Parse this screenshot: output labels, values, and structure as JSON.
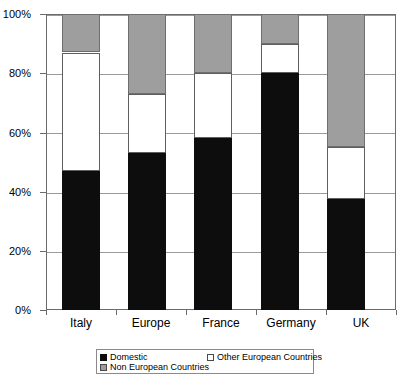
{
  "chart_data": {
    "type": "bar",
    "subtype": "stacked-100-percent",
    "title": "",
    "xlabel": "",
    "ylabel": "",
    "ylim": [
      0,
      100
    ],
    "yticks": [
      "0%",
      "20%",
      "40%",
      "60%",
      "80%",
      "100%"
    ],
    "ytick_values": [
      0,
      20,
      40,
      60,
      80,
      100
    ],
    "grid": true,
    "legend_position": "bottom",
    "categories": [
      "Italy",
      "Europe",
      "France",
      "Germany",
      "UK"
    ],
    "series": [
      {
        "name": "Domestic",
        "color": "#0d0d0d",
        "values": [
          47,
          53,
          58,
          80,
          37.5
        ]
      },
      {
        "name": "Other European Countries",
        "color": "#ffffff",
        "values": [
          40,
          20,
          22,
          10,
          17.5
        ]
      },
      {
        "name": "Non European Countries",
        "color": "#9e9e9e",
        "values": [
          13,
          27,
          20,
          10,
          45
        ]
      }
    ],
    "cumulative_tops": [
      {
        "category": "Italy",
        "domestic": 47,
        "through_other": 87,
        "through_non": 100
      },
      {
        "category": "Europe",
        "domestic": 53,
        "through_other": 73,
        "through_non": 100
      },
      {
        "category": "France",
        "domestic": 58,
        "through_other": 80,
        "through_non": 100
      },
      {
        "category": "Germany",
        "domestic": 80,
        "through_other": 90,
        "through_non": 100
      },
      {
        "category": "UK",
        "domestic": 37.5,
        "through_other": 55,
        "through_non": 100
      }
    ]
  }
}
